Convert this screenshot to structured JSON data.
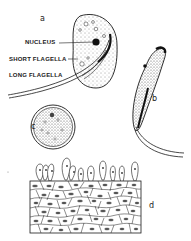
{
  "figure": {
    "panels": [
      {
        "id": "a",
        "label": "a"
      },
      {
        "id": "b",
        "label": "b"
      },
      {
        "id": "c",
        "label": "c"
      },
      {
        "id": "d",
        "label": "d"
      }
    ],
    "annotations": {
      "nucleus": "NUCLEUS",
      "short_flagella": "SHORT FLAGELLA",
      "long_flagella": "LONG FLAGELLA"
    },
    "colors": {
      "ink": "#1a1a1a",
      "background": "#ffffff"
    }
  }
}
